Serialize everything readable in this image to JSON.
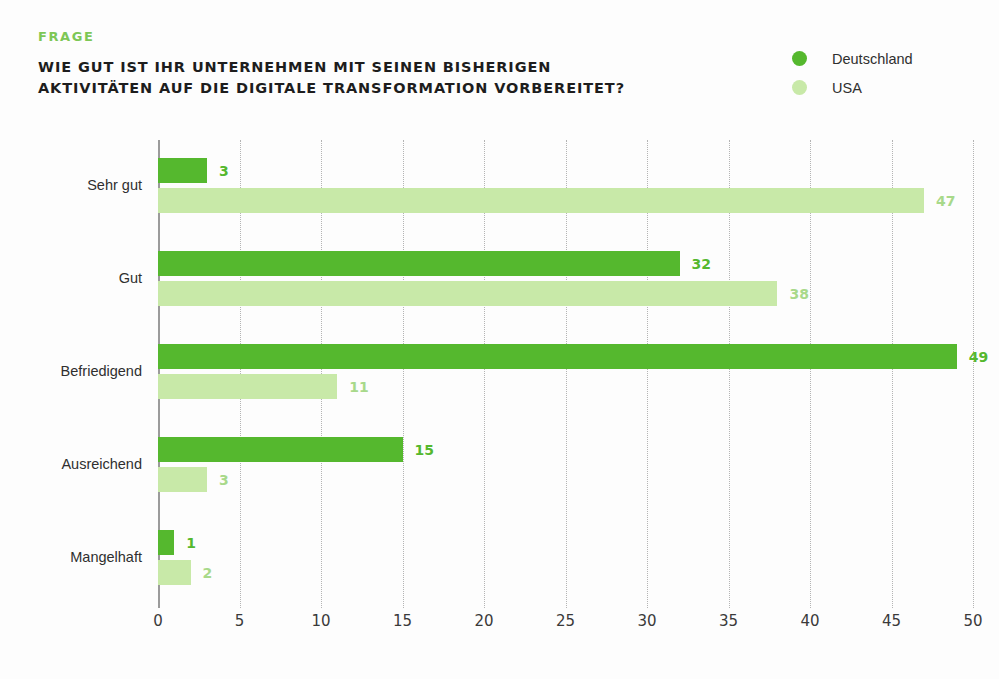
{
  "header": {
    "kicker": "FRAGE",
    "title": "WIE GUT IST IHR UNTERNEHMEN MIT SEINEN BISHERIGEN\nAKTIVITÄTEN AUF DIE DIGITALE TRANSFORMATION VORBEREITET?"
  },
  "legend": {
    "position": "top-right",
    "items": [
      {
        "label": "Deutschland",
        "color": "#55b82e"
      },
      {
        "label": "USA",
        "color": "#c8e9a8"
      }
    ]
  },
  "axis": {
    "unit_label": "in %",
    "tick_labels": [
      "0",
      "5",
      "10",
      "15",
      "20",
      "25",
      "30",
      "35",
      "40",
      "45",
      "50"
    ]
  },
  "colors": {
    "deutschland": "#55b82e",
    "usa": "#c8e9a8",
    "kicker": "#7dc756",
    "value_label_deutschland": "#55b82e",
    "value_label_usa": "#a8d98a",
    "gridline": "#b4b4b4",
    "axis": "#9b9b9b",
    "background": "#fdfdfd",
    "text": "#2f2f2f"
  },
  "chart_data": {
    "type": "bar",
    "orientation": "horizontal",
    "title": "WIE GUT IST IHR UNTERNEHMEN MIT SEINEN BISHERIGEN AKTIVITÄTEN AUF DIE DIGITALE TRANSFORMATION VORBEREITET?",
    "subtitle": "FRAGE",
    "categories": [
      "Sehr gut",
      "Gut",
      "Befriedigend",
      "Ausreichend",
      "Mangelhaft"
    ],
    "series": [
      {
        "name": "Deutschland",
        "color": "#55b82e",
        "values": [
          3,
          32,
          49,
          15,
          1
        ]
      },
      {
        "name": "USA",
        "color": "#c8e9a8",
        "values": [
          47,
          38,
          11,
          3,
          2
        ]
      }
    ],
    "xlabel": "in %",
    "ylabel": "",
    "xlim": [
      0,
      50
    ],
    "xticks": [
      0,
      5,
      10,
      15,
      20,
      25,
      30,
      35,
      40,
      45,
      50
    ],
    "grid": "vertical-dotted",
    "data_labels": true,
    "legend_position": "top-right"
  }
}
